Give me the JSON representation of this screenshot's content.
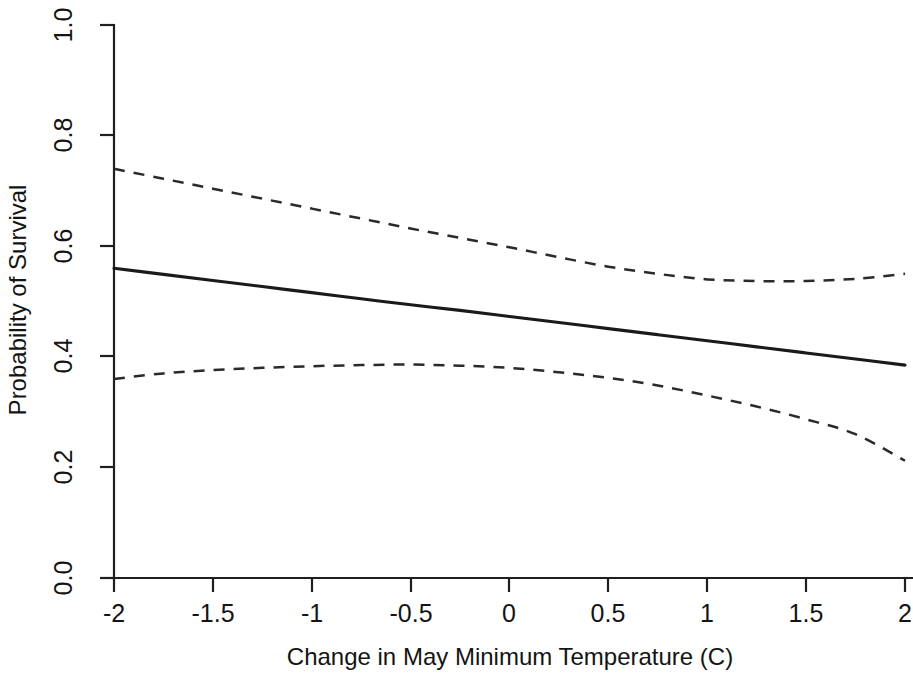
{
  "chart_data": {
    "type": "line",
    "title": "",
    "xlabel": "Change in May Minimum Temperature (C)",
    "ylabel": "Probability of Survival",
    "xlim": [
      -2,
      2
    ],
    "ylim": [
      0,
      1
    ],
    "grid": false,
    "legend": "none",
    "xticks": [
      -2,
      -1.5,
      -1,
      -0.5,
      0,
      0.5,
      1,
      1.5,
      2
    ],
    "xtick_labels": [
      "-2",
      "-1.5",
      "-1",
      "-0.5",
      "0",
      "0.5",
      "1",
      "1.5",
      "2"
    ],
    "yticks": [
      0,
      0.2,
      0.4,
      0.6,
      0.8,
      1
    ],
    "ytick_labels": [
      "0.0",
      "0.2",
      "0.4",
      "0.6",
      "0.8",
      "1.0"
    ],
    "x": [
      -2,
      -1.75,
      -1.5,
      -1.25,
      -1,
      -0.75,
      -0.5,
      -0.25,
      0,
      0.25,
      0.5,
      0.75,
      1,
      1.25,
      1.5,
      1.75,
      2
    ],
    "series": [
      {
        "name": "Predicted probability of survival",
        "style": "solid",
        "color": "#1a1a1a",
        "values": [
          0.56,
          0.549,
          0.538,
          0.527,
          0.516,
          0.505,
          0.494,
          0.484,
          0.473,
          0.462,
          0.451,
          0.44,
          0.429,
          0.418,
          0.407,
          0.396,
          0.385
        ]
      },
      {
        "name": "Upper 95% confidence limit",
        "style": "dashed",
        "color": "#2a2a2a",
        "values": [
          0.74,
          0.722,
          0.704,
          0.686,
          0.668,
          0.65,
          0.632,
          0.615,
          0.598,
          0.58,
          0.563,
          0.55,
          0.54,
          0.537,
          0.537,
          0.541,
          0.55
        ]
      },
      {
        "name": "Lower 95% confidence limit",
        "style": "dashed",
        "color": "#2a2a2a",
        "values": [
          0.36,
          0.37,
          0.376,
          0.38,
          0.383,
          0.385,
          0.386,
          0.384,
          0.38,
          0.372,
          0.362,
          0.348,
          0.33,
          0.31,
          0.287,
          0.26,
          0.212
        ]
      }
    ]
  },
  "axes": {
    "x_title": "Change in May Minimum Temperature (C)",
    "y_title": "Probability of Survival",
    "x_labels": [
      "-2",
      "-1.5",
      "-1",
      "-0.5",
      "0",
      "0.5",
      "1",
      "1.5",
      "2"
    ],
    "y_labels": [
      "0.0",
      "0.2",
      "0.4",
      "0.6",
      "0.8",
      "1.0"
    ]
  }
}
